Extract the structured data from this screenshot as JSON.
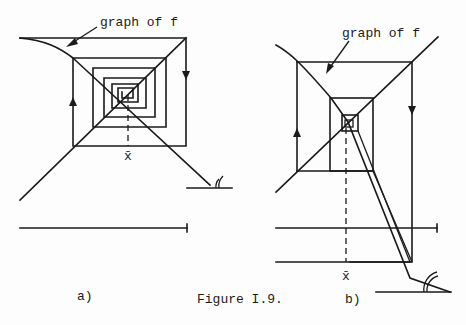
{
  "figure": {
    "caption": "Figure I.9.",
    "panels": [
      {
        "label": "a)",
        "annotation": "graph of f",
        "fixed_point_label": "x̄"
      },
      {
        "label": "b)",
        "annotation": "graph of f",
        "fixed_point_label": "x̄"
      }
    ]
  }
}
